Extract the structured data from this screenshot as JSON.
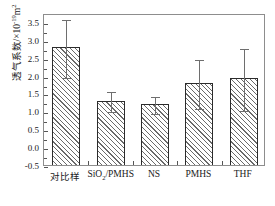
{
  "chart_data": {
    "type": "bar",
    "title": "",
    "xlabel": "",
    "ylabel": "透气系数/×10⁻¹⁹m²",
    "ylabel_text": "透气系数/×10",
    "ylabel_exponent": "-19",
    "ylabel_unit": "m",
    "ylabel_unit_exponent": "2",
    "categories": [
      "对比样",
      "SiO₂/PMHS",
      "NS",
      "PMHS",
      "THF"
    ],
    "values": [
      2.8,
      1.3,
      1.2,
      1.8,
      1.93
    ],
    "error_low": [
      1.95,
      1.0,
      0.95,
      1.1,
      1.05
    ],
    "error_high": [
      3.6,
      1.6,
      1.45,
      2.5,
      2.8
    ],
    "ylim": [
      -0.5,
      3.75
    ],
    "ytick_values": [
      -0.5,
      0.0,
      0.5,
      1.0,
      1.5,
      2.0,
      2.5,
      3.0,
      3.5
    ],
    "ytick_labels": [
      "-0.5",
      "0.0",
      "0.5",
      "1.0",
      "1.5",
      "2.0",
      "2.5",
      "3.0",
      "3.5"
    ],
    "grid": false,
    "legend": false,
    "bar_fill": "hatched-diagonal",
    "bar_edge_color": "#2b2b2b",
    "error_bar_color": "#6e6e6e",
    "frame_color": "#8d8d8d",
    "background": "#ffffff"
  },
  "axis_labels": {
    "cat_0_text": "对比样",
    "cat_1_pre": "SiO",
    "cat_1_sub": "2",
    "cat_1_post": "/PMHS",
    "cat_2_text": "NS",
    "cat_3_text": "PMHS",
    "cat_4_text": "THF"
  }
}
